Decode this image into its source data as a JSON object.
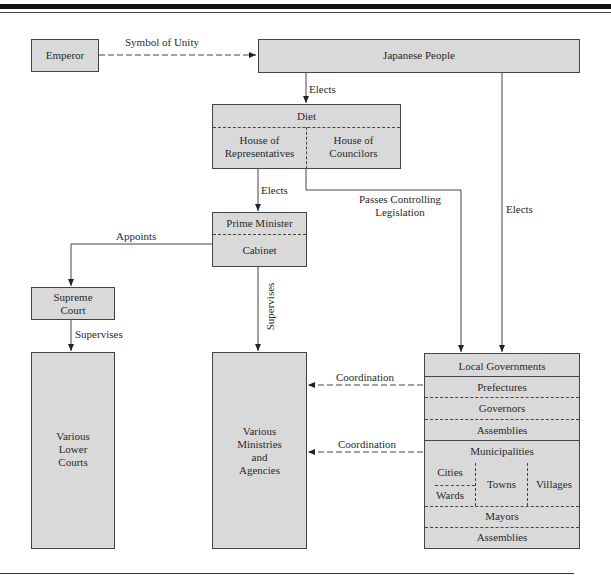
{
  "nodes": {
    "emperor": "Emperor",
    "japanese_people": "Japanese People",
    "diet": {
      "title": "Diet",
      "house_reps_line1": "House of",
      "house_reps_line2": "Representatives",
      "house_councilors_line1": "House of",
      "house_councilors_line2": "Councilors"
    },
    "prime_minister": "Prime Minister",
    "cabinet": "Cabinet",
    "supreme_court_line1": "Supreme",
    "supreme_court_line2": "Court",
    "lower_courts": [
      "Various",
      "Lower",
      "Courts"
    ],
    "ministries": [
      "Various",
      "Ministries",
      "and",
      "Agencies"
    ],
    "local_governments": {
      "title": "Local Governments",
      "prefectures": "Prefectures",
      "governors": "Governors",
      "assemblies_1": "Assemblies",
      "municipalities": "Municipalities",
      "cities": "Cities",
      "wards": "Wards",
      "towns": "Towns",
      "villages": "Villages",
      "mayors": "Mayors",
      "assemblies_2": "Assemblies"
    }
  },
  "edges": {
    "symbol_of_unity": "Symbol of Unity",
    "elects_diet": "Elects",
    "elects_pm": "Elects",
    "passes_line1": "Passes Controlling",
    "passes_line2": "Legislation",
    "elects_local": "Elects",
    "appoints": "Appoints",
    "supervises_courts": "Supervises",
    "supervises_ministries": "Supervises",
    "coordination_1": "Coordination",
    "coordination_2": "Coordination"
  }
}
